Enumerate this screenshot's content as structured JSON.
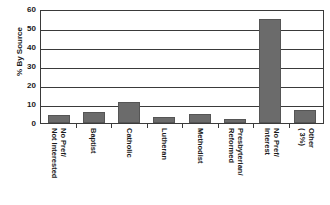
{
  "chart_data": {
    "type": "bar",
    "title": "",
    "xlabel": "",
    "ylabel": "% By Source",
    "ylim": [
      0,
      60
    ],
    "ytick_values": [
      60,
      50,
      40,
      30,
      20,
      10,
      0
    ],
    "ytick_labels": [
      "60",
      "50",
      "40",
      "30",
      "20",
      "10",
      "0"
    ],
    "grid": true,
    "legend": "none",
    "bar_color": "#6b6b6b",
    "categories": [
      "No Pref/ Not Interested",
      "Baptist",
      "Catholic",
      "Lutheran",
      "Methodist",
      "Presbyterian/ Reformed",
      "No Pref/ Interest",
      "Other ( 3%)"
    ],
    "category_lines": [
      [
        "No Pref/",
        "Not Interested"
      ],
      [
        "Baptist"
      ],
      [
        "Catholic"
      ],
      [
        "Lutheran"
      ],
      [
        "Methodist"
      ],
      [
        "Presbyterian/",
        "Reformed"
      ],
      [
        "No Pref/",
        "Interest"
      ],
      [
        "Other",
        "( 3%)"
      ]
    ],
    "values": [
      4,
      6,
      11,
      3,
      5,
      2,
      55,
      7
    ]
  }
}
